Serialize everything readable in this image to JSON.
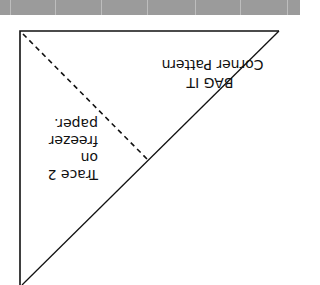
{
  "header_band": {
    "color": "#9b9b9b",
    "seam_positions": [
      10,
      55,
      101,
      147,
      195,
      240,
      287
    ]
  },
  "pattern": {
    "title_line1": "Corner Pattern",
    "title_line2": "BAG IT",
    "instruction_lines": [
      "Trace 2",
      "on",
      "freezer",
      "paper."
    ],
    "orientation": "rotated-180",
    "shape": "right-triangle",
    "stroke_color": "#111111",
    "fold_line": "dashed"
  }
}
